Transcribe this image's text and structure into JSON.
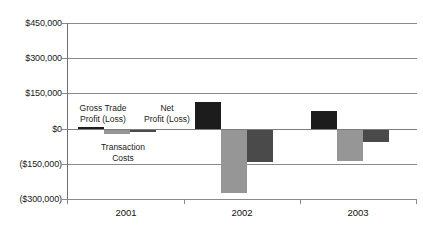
{
  "chart_data": {
    "type": "bar",
    "title": "",
    "xlabel": "",
    "ylabel": "",
    "categories": [
      "2001",
      "2002",
      "2003"
    ],
    "series": [
      {
        "name": "Gross Trade Profit (Loss)",
        "color": "#1c1c1c",
        "values": [
          8000,
          115000,
          75000
        ]
      },
      {
        "name": "Transaction Costs",
        "color": "#969696",
        "values": [
          -20000,
          -270000,
          -135000
        ]
      },
      {
        "name": "Net Profit (Loss)",
        "color": "#4a4a4a",
        "values": [
          -12000,
          -140000,
          -55000
        ]
      }
    ],
    "ylim": [
      -300000,
      450000
    ],
    "yticks": [
      450000,
      300000,
      150000,
      0,
      -150000,
      -300000
    ],
    "ytick_labels": [
      "$450,000",
      "$300,000",
      "$150,000",
      "$0",
      "($150,000)",
      "($300,000)"
    ],
    "grid": true,
    "legend_position": "inline-annotations",
    "annotations": [
      {
        "name": "gross-trade-profit-label",
        "line1": "Gross Trade",
        "line2": "Profit (Loss)"
      },
      {
        "name": "net-profit-label",
        "line1": "Net",
        "line2": "Profit (Loss)"
      },
      {
        "name": "transaction-costs-label",
        "line1": "Transaction",
        "line2": "Costs"
      }
    ]
  }
}
